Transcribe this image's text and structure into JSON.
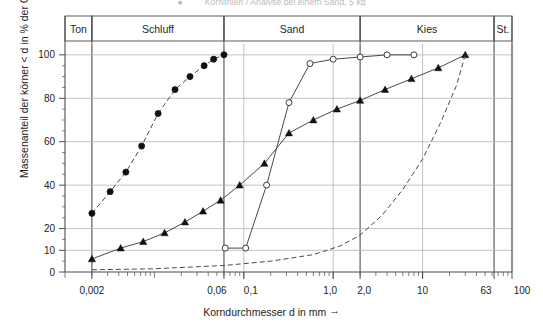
{
  "figure": {
    "title_fragment": "Kornlinien / Analyse bei einem Sand, 5 kg",
    "bullet_glyph": "●"
  },
  "axes": {
    "ylabel": "Massenanteil der körner < d in % der Gesamtmasse",
    "xlabel": "Korndurchmesser d in mm",
    "xlabel_arrow": "→",
    "y_ticks": [
      "0",
      "10",
      "20",
      "40",
      "60",
      "80",
      "100"
    ],
    "y_tick_values": [
      0,
      10,
      20,
      40,
      60,
      80,
      100
    ],
    "y_range": [
      0,
      105
    ],
    "x_tick_labels": [
      "0,002",
      "0,06",
      "0,1",
      "1,0",
      "2,0",
      "10",
      "63",
      "100"
    ],
    "x_tick_values": [
      0.002,
      0.06,
      0.1,
      1.0,
      2.0,
      10,
      63,
      100
    ],
    "x_range": [
      0.001,
      100
    ],
    "grid": true,
    "x_scale": "log"
  },
  "soil_bands": [
    {
      "label": "Ton",
      "from": 0.001,
      "to": 0.002
    },
    {
      "label": "Schluff",
      "from": 0.002,
      "to": 0.06
    },
    {
      "label": "Sand",
      "from": 0.06,
      "to": 2.0
    },
    {
      "label": "Kies",
      "from": 2.0,
      "to": 63
    },
    {
      "label": "St.",
      "from": 63,
      "to": 100
    }
  ],
  "chart_data": {
    "type": "line",
    "title": "Kornlinien / Analyse bei einem Sand, 5 kg",
    "xlabel": "Korndurchmesser d in mm",
    "ylabel": "Massenanteil der körner < d in % der Gesamtmasse",
    "xlim": [
      0.001,
      100
    ],
    "ylim": [
      0,
      105
    ],
    "x_scale": "log",
    "grid": true,
    "legend_position": "none",
    "series": [
      {
        "name": "Kornlinie 1 (Schluff, Punkte)",
        "marker": "filled-circle",
        "line": "dashed",
        "points": [
          {
            "d": 0.002,
            "p": 27
          },
          {
            "d": 0.0032,
            "p": 37
          },
          {
            "d": 0.0048,
            "p": 46
          },
          {
            "d": 0.0072,
            "p": 58
          },
          {
            "d": 0.011,
            "p": 73
          },
          {
            "d": 0.017,
            "p": 84
          },
          {
            "d": 0.025,
            "p": 90
          },
          {
            "d": 0.036,
            "p": 95
          },
          {
            "d": 0.046,
            "p": 98
          },
          {
            "d": 0.06,
            "p": 100
          }
        ]
      },
      {
        "name": "Kornlinie 2 (Dreiecke)",
        "marker": "filled-triangle",
        "line": "solid",
        "points": [
          {
            "d": 0.002,
            "p": 6
          },
          {
            "d": 0.0042,
            "p": 11
          },
          {
            "d": 0.0075,
            "p": 14
          },
          {
            "d": 0.013,
            "p": 18
          },
          {
            "d": 0.022,
            "p": 23
          },
          {
            "d": 0.035,
            "p": 28
          },
          {
            "d": 0.055,
            "p": 33
          },
          {
            "d": 0.09,
            "p": 40
          },
          {
            "d": 0.17,
            "p": 50
          },
          {
            "d": 0.32,
            "p": 64
          },
          {
            "d": 0.6,
            "p": 70
          },
          {
            "d": 1.1,
            "p": 75
          },
          {
            "d": 2.0,
            "p": 79
          },
          {
            "d": 3.8,
            "p": 84
          },
          {
            "d": 7.5,
            "p": 89
          },
          {
            "d": 15.0,
            "p": 94
          },
          {
            "d": 30.0,
            "p": 100
          }
        ]
      },
      {
        "name": "Kornlinie 3 (Sand, offene Kreise)",
        "marker": "open-circle",
        "line": "solid",
        "points": [
          {
            "d": 0.062,
            "p": 11
          },
          {
            "d": 0.105,
            "p": 11
          },
          {
            "d": 0.18,
            "p": 40
          },
          {
            "d": 0.32,
            "p": 78
          },
          {
            "d": 0.55,
            "p": 96
          },
          {
            "d": 1.0,
            "p": 98
          },
          {
            "d": 2.0,
            "p": 99
          },
          {
            "d": 4.0,
            "p": 100
          },
          {
            "d": 8.0,
            "p": 100
          }
        ]
      },
      {
        "name": "Kornlinie 4 (Kies, gestrichelt)",
        "marker": "none",
        "line": "dashed",
        "points": [
          {
            "d": 0.002,
            "p": 1
          },
          {
            "d": 0.01,
            "p": 1.5
          },
          {
            "d": 0.06,
            "p": 3
          },
          {
            "d": 0.2,
            "p": 5
          },
          {
            "d": 0.6,
            "p": 8
          },
          {
            "d": 1.2,
            "p": 12
          },
          {
            "d": 2.0,
            "p": 17
          },
          {
            "d": 3.5,
            "p": 26
          },
          {
            "d": 6.0,
            "p": 38
          },
          {
            "d": 10.0,
            "p": 52
          },
          {
            "d": 16.0,
            "p": 69
          },
          {
            "d": 24.0,
            "p": 86
          },
          {
            "d": 30.0,
            "p": 100
          }
        ]
      }
    ]
  },
  "colors": {
    "frame": "#4d4d4d",
    "grid": "#b4b4b4",
    "series": "#4a4a4a",
    "text": "#232323",
    "title_faded": "#bdbdbd",
    "background": "#ffffff"
  }
}
